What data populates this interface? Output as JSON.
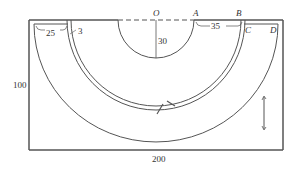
{
  "diagram": {
    "type": "geometry-figure",
    "points": {
      "O": "O",
      "A": "A",
      "B": "B",
      "C": "C",
      "D": "D"
    },
    "dimensions": {
      "width_label": "200",
      "height_label": "100",
      "radius_label": "30",
      "AB_label": "35",
      "strip_width_label": "25",
      "gap_label": "3"
    },
    "colors": {
      "line": "#555555",
      "text": "#333333",
      "background": "#ffffff"
    }
  }
}
